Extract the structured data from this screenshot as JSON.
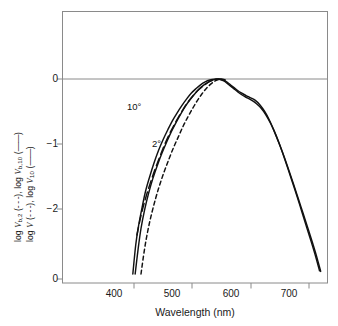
{
  "chart_data": {
    "type": "line",
    "title": "",
    "xlabel": "Wavelength (nm)",
    "ylabel_line_1": "log V_{b,2} (–––), log V_{b,10} (——)",
    "ylabel_line_2": "log V (–––), log V_{10} (——)",
    "xlim": [
      360,
      745
    ],
    "ylim": [
      -3,
      0.55
    ],
    "xticks": [
      400,
      500,
      600,
      700
    ],
    "yticks": [
      0,
      -1,
      -2,
      0
    ],
    "ytick_labels": [
      "0",
      "−1",
      "−2",
      "0"
    ],
    "xtick_labels": [
      "400",
      "500",
      "600",
      "700"
    ],
    "grid": false,
    "legend_position": "inline-annotations",
    "annotations": [
      {
        "text": "10°",
        "x": 455,
        "y": -0.52
      },
      {
        "text": "2°",
        "x": 492,
        "y": -1.07
      }
    ],
    "series": [
      {
        "name": "log V_10 (10-degree observer)",
        "style": "solid",
        "color": "#111111",
        "points": [
          [
            398,
            -3.0
          ],
          [
            403,
            -2.55
          ],
          [
            408,
            -2.25
          ],
          [
            414,
            -1.97
          ],
          [
            420,
            -1.72
          ],
          [
            427,
            -1.5
          ],
          [
            434,
            -1.3
          ],
          [
            442,
            -1.1
          ],
          [
            450,
            -0.93
          ],
          [
            458,
            -0.78
          ],
          [
            466,
            -0.64
          ],
          [
            474,
            -0.52
          ],
          [
            482,
            -0.41
          ],
          [
            490,
            -0.31
          ],
          [
            498,
            -0.22
          ],
          [
            506,
            -0.15
          ],
          [
            514,
            -0.09
          ],
          [
            522,
            -0.045
          ],
          [
            530,
            -0.016
          ],
          [
            538,
            -0.002
          ],
          [
            546,
            -0.004
          ],
          [
            554,
            -0.03
          ],
          [
            562,
            -0.085
          ],
          [
            570,
            -0.14
          ],
          [
            578,
            -0.2
          ],
          [
            586,
            -0.25
          ],
          [
            594,
            -0.29
          ],
          [
            602,
            -0.33
          ],
          [
            610,
            -0.38
          ],
          [
            618,
            -0.45
          ],
          [
            626,
            -0.55
          ],
          [
            634,
            -0.68
          ],
          [
            642,
            -0.84
          ],
          [
            650,
            -1.02
          ],
          [
            658,
            -1.21
          ],
          [
            666,
            -1.42
          ],
          [
            674,
            -1.63
          ],
          [
            682,
            -1.85
          ],
          [
            690,
            -2.07
          ],
          [
            698,
            -2.29
          ],
          [
            706,
            -2.52
          ],
          [
            714,
            -2.76
          ],
          [
            720,
            -2.96
          ]
        ]
      },
      {
        "name": "log V_b,10 (10-degree brightness)",
        "style": "solid",
        "color": "#111111",
        "points": [
          [
            402,
            -3.0
          ],
          [
            407,
            -2.62
          ],
          [
            412,
            -2.3
          ],
          [
            418,
            -2.02
          ],
          [
            425,
            -1.76
          ],
          [
            432,
            -1.54
          ],
          [
            440,
            -1.33
          ],
          [
            448,
            -1.14
          ],
          [
            456,
            -0.97
          ],
          [
            464,
            -0.81
          ],
          [
            472,
            -0.67
          ],
          [
            480,
            -0.54
          ],
          [
            488,
            -0.42
          ],
          [
            496,
            -0.32
          ],
          [
            504,
            -0.23
          ],
          [
            512,
            -0.15
          ],
          [
            520,
            -0.09
          ],
          [
            528,
            -0.045
          ],
          [
            536,
            -0.013
          ],
          [
            544,
            -0.001
          ],
          [
            552,
            -0.012
          ],
          [
            560,
            -0.05
          ],
          [
            568,
            -0.11
          ],
          [
            576,
            -0.165
          ],
          [
            584,
            -0.215
          ],
          [
            592,
            -0.255
          ],
          [
            600,
            -0.29
          ],
          [
            608,
            -0.33
          ],
          [
            616,
            -0.4
          ],
          [
            624,
            -0.5
          ],
          [
            632,
            -0.63
          ],
          [
            640,
            -0.79
          ],
          [
            648,
            -0.97
          ],
          [
            656,
            -1.17
          ],
          [
            664,
            -1.38
          ],
          [
            672,
            -1.6
          ],
          [
            680,
            -1.82
          ],
          [
            688,
            -2.05
          ],
          [
            696,
            -2.28
          ],
          [
            704,
            -2.51
          ],
          [
            712,
            -2.75
          ],
          [
            718,
            -2.95
          ]
        ]
      },
      {
        "name": "log V (2-degree observer)",
        "style": "dashed",
        "color": "#111111",
        "points": [
          [
            412,
            -3.0
          ],
          [
            418,
            -2.62
          ],
          [
            424,
            -2.32
          ],
          [
            430,
            -2.08
          ],
          [
            437,
            -1.84
          ],
          [
            444,
            -1.63
          ],
          [
            452,
            -1.42
          ],
          [
            460,
            -1.23
          ],
          [
            468,
            -1.05
          ],
          [
            476,
            -0.89
          ],
          [
            484,
            -0.73
          ],
          [
            492,
            -0.59
          ],
          [
            500,
            -0.46
          ],
          [
            508,
            -0.34
          ],
          [
            516,
            -0.235
          ],
          [
            524,
            -0.145
          ],
          [
            532,
            -0.075
          ],
          [
            540,
            -0.025
          ],
          [
            548,
            -0.002
          ],
          [
            554,
            -0.005
          ],
          [
            560,
            -0.03
          ]
        ]
      },
      {
        "name": "log V_b,2 (2-degree brightness)",
        "style": "dashed-long",
        "color": "#111111",
        "points": [
          [
            405,
            -2.4
          ],
          [
            412,
            -2.1
          ],
          [
            420,
            -1.83
          ],
          [
            428,
            -1.6
          ],
          [
            436,
            -1.39
          ],
          [
            444,
            -1.2
          ],
          [
            452,
            -1.02
          ],
          [
            460,
            -0.86
          ],
          [
            468,
            -0.72
          ],
          [
            476,
            -0.59
          ],
          [
            484,
            -0.47
          ],
          [
            492,
            -0.36
          ],
          [
            500,
            -0.27
          ],
          [
            508,
            -0.19
          ],
          [
            516,
            -0.125
          ],
          [
            524,
            -0.07
          ],
          [
            532,
            -0.03
          ],
          [
            540,
            -0.008
          ],
          [
            548,
            -0.001
          ]
        ]
      }
    ]
  }
}
